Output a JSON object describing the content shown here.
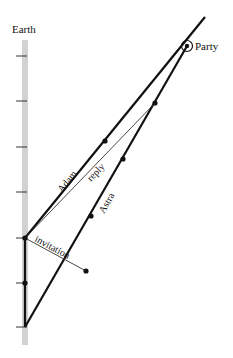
{
  "diagram": {
    "type": "spacetime-diagram",
    "earth_label": "Earth",
    "party_label": "Party",
    "worldlines": {
      "earth": {
        "label": "Earth",
        "x": 25,
        "y_top": 40,
        "y_bottom": 345,
        "color": "#d0d0d0"
      },
      "adam": {
        "label": "Adam",
        "from": [
          25,
          238
        ],
        "to": [
          205,
          17
        ]
      },
      "astra": {
        "label": "Astra",
        "from": [
          25,
          327
        ],
        "to": [
          187,
          46
        ]
      }
    },
    "signals": {
      "invitation": {
        "label": "invitation",
        "from": [
          25,
          238
        ],
        "to": [
          86,
          271
        ]
      },
      "reply": {
        "label": "reply",
        "from": [
          155,
          103
        ],
        "to": [
          25,
          238
        ]
      }
    },
    "earth_ticks_y": [
      56,
      101,
      147,
      192,
      238,
      283,
      327
    ],
    "events": [
      {
        "name": "earth-event-top",
        "x": 25,
        "y": 238
      },
      {
        "name": "earth-event-mid",
        "x": 25,
        "y": 283
      },
      {
        "name": "adam-event",
        "x": 105,
        "y": 141
      },
      {
        "name": "astra-event-invitation",
        "x": 86,
        "y": 271
      },
      {
        "name": "astra-event-1",
        "x": 91,
        "y": 216
      },
      {
        "name": "astra-event-2",
        "x": 123,
        "y": 159
      },
      {
        "name": "astra-event-reply",
        "x": 155,
        "y": 103
      }
    ],
    "party_event": {
      "x": 187,
      "y": 46
    }
  }
}
